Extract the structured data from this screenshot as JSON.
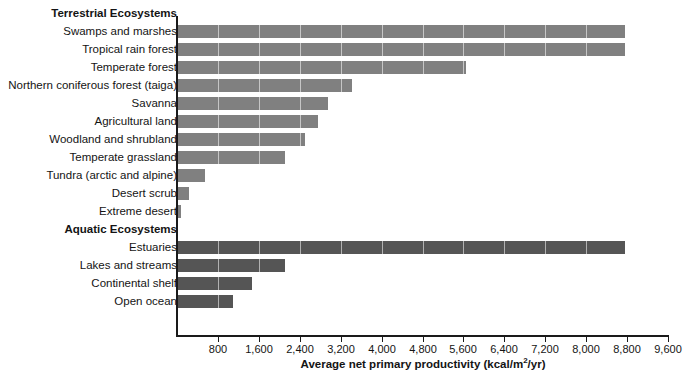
{
  "chart_data": {
    "type": "bar",
    "orientation": "horizontal",
    "title": "",
    "xlabel": "Average net primary productivity (kcal/m2/yr)",
    "xlabel_parts": {
      "before": "Average net primary productivity (kcal/m",
      "sup": "2",
      "after": "/yr)"
    },
    "ylabel": "",
    "xlim": [
      0,
      9600
    ],
    "xticks": [
      800,
      1600,
      2400,
      3200,
      4000,
      4800,
      5600,
      6400,
      7200,
      8000,
      8800,
      9600
    ],
    "xticklabels": [
      "800",
      "1,600",
      "2,400",
      "3,200",
      "4,000",
      "4,800",
      "5,600",
      "6,400",
      "7,200",
      "8,000",
      "8,800",
      "9,600"
    ],
    "grid": "faint vertical gridlines at tick positions",
    "legend": "none",
    "groups": [
      {
        "name": "Terrestrial Ecosystems",
        "color": "#808080",
        "categories": [
          "Swamps and marshes",
          "Tropical rain forest",
          "Temperate forest",
          "Northern coniferous forest (taiga)",
          "Savanna",
          "Agricultural land",
          "Woodland and shrubland",
          "Temperate grassland",
          "Tundra (arctic and alpine)",
          "Desert scrub",
          "Extreme desert"
        ],
        "values": [
          8750,
          8750,
          5650,
          3420,
          2950,
          2750,
          2500,
          2110,
          550,
          230,
          70
        ]
      },
      {
        "name": "Aquatic Ecosystems",
        "color": "#555555",
        "categories": [
          "Estuaries",
          "Lakes and streams",
          "Continental shelf",
          "Open ocean"
        ],
        "values": [
          8750,
          2110,
          1470,
          1100
        ]
      }
    ]
  },
  "rows": [
    {
      "label": "Terrestrial Ecosystems",
      "header": true
    },
    {
      "label": "Swamps and marshes",
      "value": 8750,
      "group": "terrestrial"
    },
    {
      "label": "Tropical rain forest",
      "value": 8750,
      "group": "terrestrial"
    },
    {
      "label": "Temperate forest",
      "value": 5650,
      "group": "terrestrial"
    },
    {
      "label": "Northern coniferous forest (taiga)",
      "value": 3420,
      "group": "terrestrial"
    },
    {
      "label": "Savanna",
      "value": 2950,
      "group": "terrestrial"
    },
    {
      "label": "Agricultural land",
      "value": 2750,
      "group": "terrestrial"
    },
    {
      "label": "Woodland and shrubland",
      "value": 2500,
      "group": "terrestrial"
    },
    {
      "label": "Temperate grassland",
      "value": 2110,
      "group": "terrestrial"
    },
    {
      "label": "Tundra (arctic and alpine)",
      "value": 550,
      "group": "terrestrial"
    },
    {
      "label": "Desert scrub",
      "value": 230,
      "group": "terrestrial"
    },
    {
      "label": "Extreme desert",
      "value": 70,
      "group": "terrestrial"
    },
    {
      "label": "Aquatic Ecosystems",
      "header": true
    },
    {
      "label": "Estuaries",
      "value": 8750,
      "group": "aquatic"
    },
    {
      "label": "Lakes and streams",
      "value": 2110,
      "group": "aquatic"
    },
    {
      "label": "Continental shelf",
      "value": 1470,
      "group": "aquatic"
    },
    {
      "label": "Open ocean",
      "value": 1100,
      "group": "aquatic"
    }
  ],
  "colors": {
    "terrestrial_bar": "#808080",
    "aquatic_bar": "#555555",
    "axis": "#1a1a1a",
    "background": "#ffffff"
  }
}
